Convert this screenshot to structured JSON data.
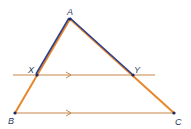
{
  "diagram": {
    "type": "triangle-with-parallel-line",
    "colors": {
      "orange": "#e8862a",
      "blue": "#2b3f8c",
      "parallel_line": "#c8864a",
      "point": "#1f2a5a",
      "label": "#2a3a5e"
    },
    "points": {
      "A": {
        "label": "A",
        "x": 70,
        "y": 19
      },
      "X": {
        "label": "X",
        "x": 37,
        "y": 75
      },
      "Y": {
        "label": "Y",
        "x": 133,
        "y": 75
      },
      "B": {
        "label": "B",
        "x": 15,
        "y": 113
      },
      "C": {
        "label": "C",
        "x": 174,
        "y": 113
      }
    },
    "segments": [
      {
        "from": "A",
        "to": "X",
        "highlight": "blue"
      },
      {
        "from": "A",
        "to": "Y",
        "highlight": "blue"
      },
      {
        "from": "X",
        "to": "B",
        "highlight": "none"
      },
      {
        "from": "Y",
        "to": "C",
        "highlight": "none"
      },
      {
        "from": "B",
        "to": "C",
        "highlight": "none",
        "parallel_mark": true
      }
    ],
    "parallel_line": {
      "through": [
        "X",
        "Y"
      ],
      "x_start": 13,
      "x_end": 155,
      "parallel_mark": true
    },
    "note": "XY is parallel to BC"
  }
}
